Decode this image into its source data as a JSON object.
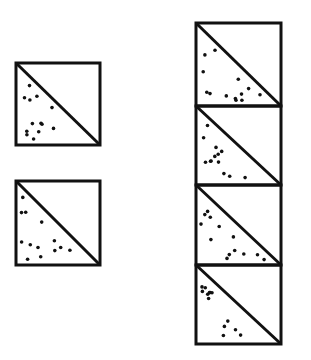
{
  "figure": {
    "colors": {
      "line": "#111111",
      "background": "#ffffff",
      "dots": "#111111"
    },
    "single_blocks": [
      {
        "x": 16,
        "y": 63,
        "w": 84,
        "h": 82
      },
      {
        "x": 16,
        "y": 181,
        "w": 84,
        "h": 84
      }
    ],
    "column_blocks": [
      {
        "x": 196,
        "y": 23,
        "w": 85,
        "h": 83
      },
      {
        "x": 196,
        "y": 106,
        "w": 85,
        "h": 79
      },
      {
        "x": 196,
        "y": 185,
        "w": 85,
        "h": 80
      },
      {
        "x": 196,
        "y": 265,
        "w": 85,
        "h": 79
      }
    ],
    "shading": "stippled lower-left triangle"
  }
}
